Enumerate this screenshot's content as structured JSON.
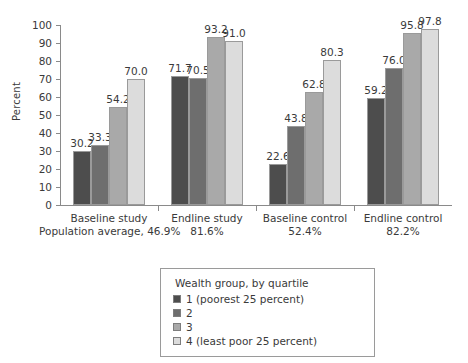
{
  "chart_data": {
    "type": "bar",
    "title": "",
    "subtitle": "",
    "xlabel": "",
    "ylabel": "Percent",
    "ylim": [
      0,
      100
    ],
    "yticks": [
      0,
      10,
      20,
      30,
      40,
      50,
      60,
      70,
      80,
      90,
      100
    ],
    "ytick_labels": [
      "0",
      "10",
      "20",
      "30",
      "40",
      "50",
      "60",
      "70",
      "80",
      "90",
      "100"
    ],
    "grid": false,
    "legend_position": "bottom-center",
    "categories": [
      "Baseline study",
      "Endline study",
      "Baseline control",
      "Endline control"
    ],
    "category_subtitles": [
      "46.9%",
      "81.6%",
      "52.4%",
      "82.2%"
    ],
    "population_average_prefix": "Population average, ",
    "series": [
      {
        "name": "1 (poorest 25 percent)",
        "color": "#4d4d4d",
        "values": [
          30.2,
          71.7,
          22.6,
          59.2
        ]
      },
      {
        "name": "2",
        "color": "#6e6e6e",
        "values": [
          33.3,
          70.5,
          43.8,
          76.0
        ]
      },
      {
        "name": "3",
        "color": "#a9a9a9",
        "values": [
          54.2,
          93.2,
          62.8,
          95.8
        ]
      },
      {
        "name": "4 (least poor 25 percent)",
        "color": "#dcdcdc",
        "values": [
          70.0,
          91.0,
          80.3,
          97.8
        ]
      }
    ],
    "value_labels": [
      [
        "30.2",
        "33.3",
        "54.2",
        "70.0"
      ],
      [
        "71.7",
        "70.5",
        "93.2",
        "91.0"
      ],
      [
        "22.6",
        "43.8",
        "62.8",
        "80.3"
      ],
      [
        "59.2",
        "76.0",
        "95.8",
        "97.8"
      ]
    ],
    "legend_title": "Wealth group, by quartile",
    "axis_color": "#8a8a8a",
    "text_color": "#3a3a3a",
    "bar_border_color": "#9a9a9a"
  }
}
